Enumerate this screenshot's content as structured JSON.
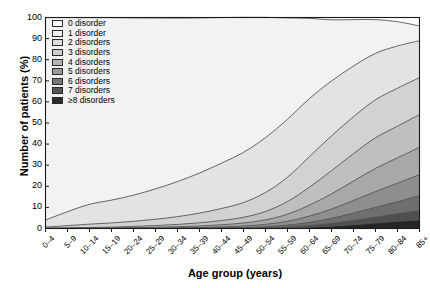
{
  "chart_data": {
    "type": "area",
    "title": "",
    "subtitle": "",
    "xlabel": "Age group (years)",
    "ylabel": "Number of patients (%)",
    "stacked": true,
    "grid": false,
    "legend_position": "top-left",
    "ylim": [
      0,
      100
    ],
    "ytick_labels": [
      "0",
      "10",
      "20",
      "30",
      "40",
      "50",
      "60",
      "70",
      "80",
      "90",
      "100"
    ],
    "ytick_values": [
      0,
      10,
      20,
      30,
      40,
      50,
      60,
      70,
      80,
      90,
      100
    ],
    "categories": [
      "0–4",
      "5–9",
      "10–14",
      "15–19",
      "20–24",
      "25–29",
      "30–34",
      "35–39",
      "40–44",
      "45–49",
      "50–54",
      "55–59",
      "60–64",
      "65–69",
      "70–74",
      "75–79",
      "80–84",
      "85+"
    ],
    "series": [
      {
        "name": "0 disorder",
        "color": "#f2f2f2",
        "values": [
          96.0,
          92.0,
          88.5,
          86.5,
          84.0,
          81.0,
          77.5,
          73.5,
          69.0,
          64.0,
          57.0,
          48.0,
          38.0,
          29.0,
          22.0,
          16.0,
          11.5,
          7.0
        ]
      },
      {
        "name": "1 disorder",
        "color": "#e3e3e3",
        "values": [
          3.3,
          6.6,
          9.4,
          10.8,
          12.4,
          14.4,
          16.6,
          19.0,
          21.5,
          23.8,
          26.0,
          27.5,
          27.5,
          26.0,
          24.0,
          22.0,
          20.0,
          17.5
        ]
      },
      {
        "name": "2 disorders",
        "color": "#d2d2d2",
        "values": [
          0.5,
          1.0,
          1.6,
          2.0,
          2.4,
          3.0,
          3.7,
          4.6,
          5.7,
          7.0,
          9.0,
          11.5,
          14.5,
          16.5,
          17.5,
          18.0,
          18.0,
          17.5
        ]
      },
      {
        "name": "3 disorders",
        "color": "#bfbfbf",
        "values": [
          0.15,
          0.25,
          0.3,
          0.4,
          0.6,
          0.8,
          1.1,
          1.5,
          2.0,
          2.7,
          4.0,
          6.0,
          8.5,
          11.0,
          13.0,
          14.5,
          15.0,
          15.5
        ]
      },
      {
        "name": "4 disorders",
        "color": "#a8a8a8",
        "values": [
          0.04,
          0.08,
          0.1,
          0.15,
          0.25,
          0.35,
          0.5,
          0.7,
          1.0,
          1.4,
          2.1,
          3.4,
          5.2,
          7.2,
          9.2,
          11.0,
          12.0,
          13.0
        ]
      },
      {
        "name": "5 disorders",
        "color": "#8e8e8e",
        "values": [
          0.01,
          0.02,
          0.04,
          0.06,
          0.1,
          0.15,
          0.2,
          0.3,
          0.45,
          0.7,
          1.1,
          1.8,
          3.0,
          4.4,
          6.0,
          7.5,
          8.8,
          10.0
        ]
      },
      {
        "name": "6 disorders",
        "color": "#6f6f6f",
        "values": [
          0.0,
          0.01,
          0.01,
          0.02,
          0.03,
          0.05,
          0.08,
          0.12,
          0.2,
          0.3,
          0.5,
          0.9,
          1.5,
          2.4,
          3.5,
          4.6,
          5.7,
          7.0
        ]
      },
      {
        "name": "7 disorders",
        "color": "#4f4f4f",
        "values": [
          0.0,
          0.0,
          0.01,
          0.01,
          0.01,
          0.02,
          0.03,
          0.05,
          0.08,
          0.12,
          0.22,
          0.4,
          0.8,
          1.3,
          2.0,
          2.8,
          3.6,
          4.5
        ]
      },
      {
        "name": "≥8 disorders",
        "color": "#252525",
        "values": [
          0.0,
          0.0,
          0.0,
          0.01,
          0.01,
          0.01,
          0.02,
          0.03,
          0.05,
          0.08,
          0.15,
          0.3,
          0.6,
          1.1,
          1.8,
          2.6,
          3.4,
          4.0
        ]
      }
    ]
  },
  "legend": {
    "items": [
      {
        "label": "0 disorder",
        "color": "#f8f8f8"
      },
      {
        "label": "1 disorder",
        "color": "#efefef"
      },
      {
        "label": "2 disorders",
        "color": "#dcdcdc"
      },
      {
        "label": "3 disorders",
        "color": "#cccccc"
      },
      {
        "label": "4 disorders",
        "color": "#b6b6b6"
      },
      {
        "label": "5 disorders",
        "color": "#9a9a9a"
      },
      {
        "label": "6 disorders",
        "color": "#787878"
      },
      {
        "label": "7 disorders",
        "color": "#555555"
      },
      {
        "label": "≥8 disorders",
        "color": "#2a2a2a"
      }
    ]
  }
}
